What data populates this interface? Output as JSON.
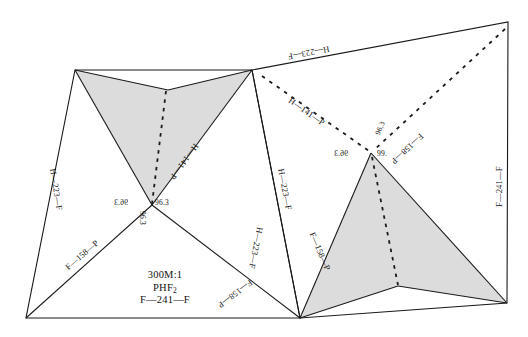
{
  "figure": {
    "background_color": "#ffffff",
    "stroke_color": "#1a1a1a",
    "fill_shaded": "#dcdcdc",
    "width": 528,
    "height": 337
  },
  "caption": {
    "scale": "300M:1",
    "formula": "PHF",
    "formula_sub": "2",
    "bond": "F—241—F"
  },
  "edge_labels": [
    {
      "id": "left-outer",
      "text": "H—223—F"
    },
    {
      "id": "left-lower",
      "text": "F—158—P"
    },
    {
      "id": "left-star-right-upper",
      "text": "H—141—P"
    },
    {
      "id": "left-star-lower-right",
      "text": "F—158—P"
    },
    {
      "id": "center-left-edge",
      "text": "H—223—F"
    },
    {
      "id": "center-right-edge",
      "text": "H—223—F"
    },
    {
      "id": "top-right-edge",
      "text": "H—223—F"
    },
    {
      "id": "right-dashed-left",
      "text": "H—141—P"
    },
    {
      "id": "right-dashed-right",
      "text": "F—158—P"
    },
    {
      "id": "right-star-lower-left",
      "text": "F—158—P"
    },
    {
      "id": "right-outer",
      "text": "F—241—F"
    }
  ],
  "angle_labels": [
    {
      "id": "left-vertex-left",
      "text": "96.3"
    },
    {
      "id": "left-vertex-right",
      "text": "96.3"
    },
    {
      "id": "left-vertex-bottom",
      "text": "96.3"
    },
    {
      "id": "right-vertex-top",
      "text": "96.3"
    },
    {
      "id": "right-vertex-left",
      "text": "96.3"
    },
    {
      "id": "right-vertex-right",
      "text": "99."
    }
  ]
}
